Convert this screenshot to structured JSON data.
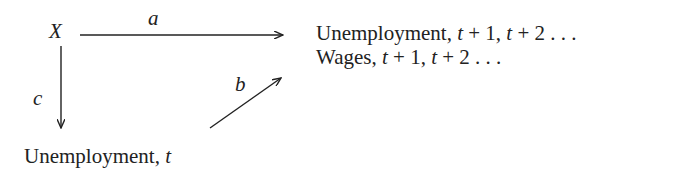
{
  "diagram": {
    "nodes": {
      "x": {
        "label": "X"
      },
      "future": {
        "line1": {
          "prefix": "Unemployment, ",
          "t1": "t",
          "p1": " + 1, ",
          "t2": "t",
          "p2": " + 2  . . ."
        },
        "line2": {
          "prefix": "Wages, ",
          "t1": "t",
          "p1": " + 1, ",
          "t2": "t",
          "p2": " + 2  . . ."
        }
      },
      "current": {
        "prefix": "Unemployment, ",
        "t": "t"
      }
    },
    "edges": [
      {
        "id": "a",
        "label": "a",
        "from": "X",
        "to": "Unemployment/Wages, t+1, t+2 ..."
      },
      {
        "id": "b",
        "label": "b",
        "from": "Unemployment, t",
        "to": "Unemployment/Wages, t+1, t+2 ..."
      },
      {
        "id": "c",
        "label": "c",
        "from": "X",
        "to": "Unemployment, t"
      }
    ],
    "colors": {
      "ink": "#222222",
      "background": "#ffffff"
    }
  }
}
